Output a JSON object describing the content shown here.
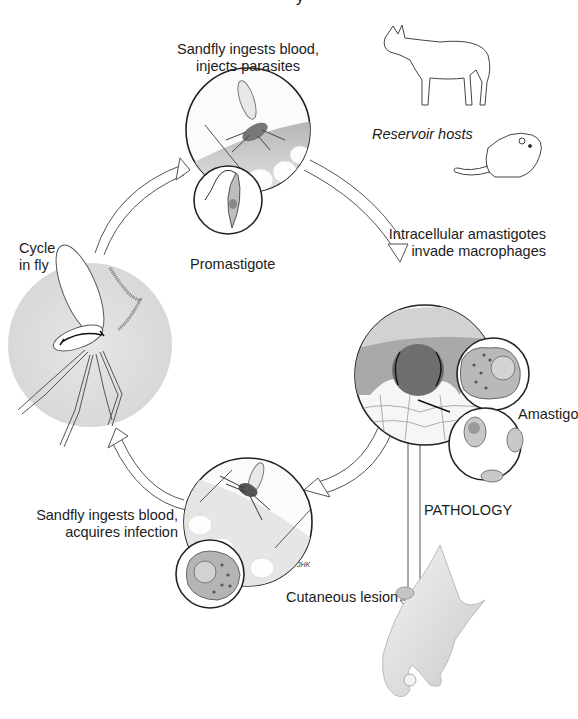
{
  "diagram": {
    "labels": {
      "title_fragment": "y",
      "ingest_inject_line1": "Sandfly ingests blood,",
      "ingest_inject_line2": "injects parasites",
      "reservoir_hosts": "Reservoir hosts",
      "promastigote": "Promastigote",
      "cycle_in_fly_line1": "Cycle",
      "cycle_in_fly_line2": "in fly",
      "amastigotes_line1": "Intracellular amastigotes",
      "amastigotes_line2": "invade macrophages",
      "amastigote_cut": "Amastigo",
      "pathology": "PATHOLOGY",
      "acquire_line1": "Sandfly ingests blood,",
      "acquire_line2": "acquires infection",
      "cutaneous_lesion": "Cutaneous lesion",
      "artist_signature": "JHK"
    },
    "stages": [
      {
        "id": "bite-inject",
        "label": "Sandfly ingests blood, injects parasites"
      },
      {
        "id": "macrophage-invasion",
        "label": "Intracellular amastigotes invade macrophages"
      },
      {
        "id": "bite-acquire",
        "label": "Sandfly ingests blood, acquires infection"
      },
      {
        "id": "fly-cycle",
        "label": "Cycle in fly"
      }
    ],
    "side_branch": {
      "label": "PATHOLOGY",
      "outcome": "Cutaneous lesion"
    },
    "colors": {
      "background": "#ffffff",
      "line": "#333333",
      "circle_fill": "#f2f2f2",
      "skin": "#d9d9d9",
      "fly_halo": "#e2e2e2"
    }
  }
}
